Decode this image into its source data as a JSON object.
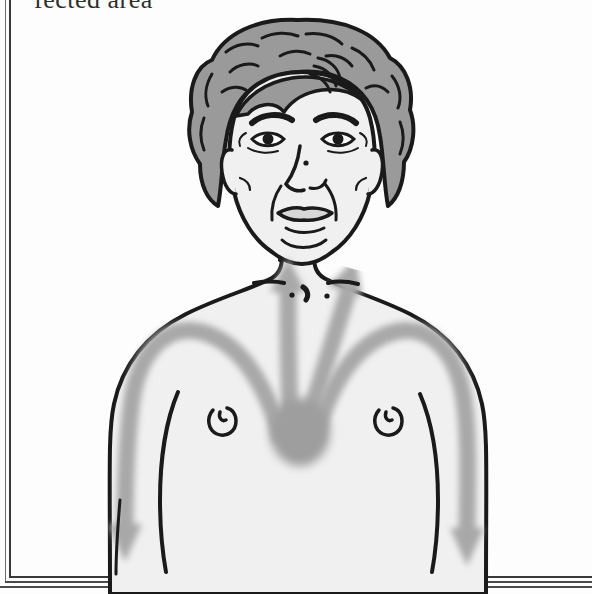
{
  "page": {
    "caption_text": "fected area",
    "caption_note": "partially cropped heading line at top of page"
  },
  "frame": {
    "left_rule": "vertical-rule",
    "bottom_rule_1": "horizontal-rule",
    "bottom_rule_2": "horizontal-rule",
    "bottom_rule_3": "horizontal-rule"
  },
  "illustration": {
    "title": "Chest pain radiation diagram",
    "subject": "front view of a person's head, neck, shoulders and upper chest",
    "arrow_count": 4,
    "arrow_origin": "center of sternum",
    "arrows": [
      {
        "name": "arrow-up-left",
        "direction": "up-left",
        "target": "left side of neck / throat"
      },
      {
        "name": "arrow-up-right",
        "direction": "up-right",
        "target": "right side of neck / throat"
      },
      {
        "name": "arrow-down-left",
        "direction": "out and down",
        "target": "left arm"
      },
      {
        "name": "arrow-down-right",
        "direction": "out and down",
        "target": "right arm"
      }
    ],
    "body_features": [
      "curly hair",
      "eyes",
      "eyebrows",
      "nose",
      "mouth",
      "ears",
      "neck",
      "collarbones",
      "sternal notch",
      "left nipple",
      "right nipple",
      "shoulders",
      "arms"
    ],
    "colors": {
      "outline": "#1a1a1a",
      "skin_fill": "#f0f0f0",
      "hair_fill": "#9a9a9a",
      "arrow_fill": "#a8a8a8",
      "arrow_core": "#8e8e8e",
      "background": "#fdfdfd",
      "caption_text": "#2e2e2e",
      "frame_rule": "#3a3a3a"
    }
  }
}
